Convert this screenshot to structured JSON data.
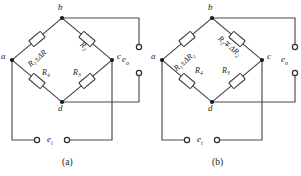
{
  "figure": {
    "type": "wheatstone-bridge-pair",
    "panels": [
      {
        "caption": "(a)",
        "nodes": {
          "top": "b",
          "left": "a",
          "right": "c",
          "bottom": "d"
        },
        "resistors": [
          {
            "position": "upper-left",
            "name": "R",
            "sub": "1",
            "op": "±",
            "delta": "ΔR",
            "delta_sub": ""
          },
          {
            "position": "upper-right",
            "name": "R",
            "sub": "2",
            "op": "",
            "delta": "",
            "delta_sub": ""
          },
          {
            "position": "lower-left",
            "name": "R",
            "sub": "4",
            "op": "",
            "delta": "",
            "delta_sub": ""
          },
          {
            "position": "lower-right",
            "name": "R",
            "sub": "3",
            "op": "",
            "delta": "",
            "delta_sub": ""
          }
        ],
        "output": {
          "label": "e",
          "sub": "o"
        },
        "input": {
          "label": "e",
          "sub": "i"
        }
      },
      {
        "caption": "(b)",
        "nodes": {
          "top": "b",
          "left": "a",
          "right": "c",
          "bottom": "d"
        },
        "resistors": [
          {
            "position": "upper-left",
            "name": "R",
            "sub": "1",
            "op": "±",
            "delta": "ΔR",
            "delta_sub": "1"
          },
          {
            "position": "upper-right",
            "name": "R",
            "sub": "2",
            "op": "∓",
            "delta": "ΔR",
            "delta_sub": "2"
          },
          {
            "position": "lower-left",
            "name": "R",
            "sub": "4",
            "op": "",
            "delta": "",
            "delta_sub": ""
          },
          {
            "position": "lower-right",
            "name": "R",
            "sub": "3",
            "op": "",
            "delta": "",
            "delta_sub": ""
          }
        ],
        "output": {
          "label": "e",
          "sub": "o"
        },
        "input": {
          "label": "e",
          "sub": "i"
        }
      }
    ],
    "colors": {
      "wire": "#4a4a4a",
      "node": "#1b1b1b",
      "resistor_body": "#ffffff",
      "resistor_outline": "#3a3a3a",
      "text": "#1b1b1b",
      "background": "#ffffff"
    }
  }
}
